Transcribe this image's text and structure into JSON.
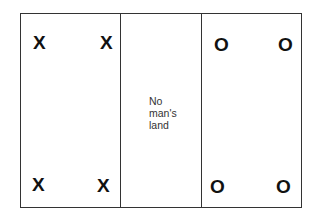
{
  "diagram": {
    "zones": {
      "left": {
        "marks": [
          "X",
          "X",
          "X",
          "X"
        ]
      },
      "middle": {
        "label_lines": [
          "No",
          "man's",
          "land"
        ]
      },
      "right": {
        "marks": [
          "O",
          "O",
          "O",
          "O"
        ]
      }
    }
  }
}
